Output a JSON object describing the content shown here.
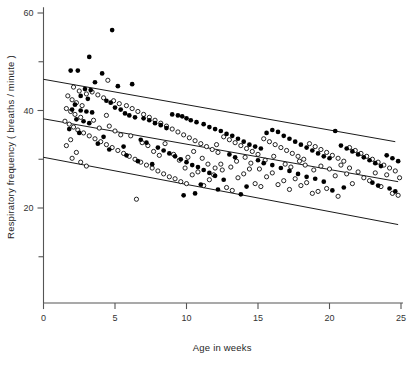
{
  "chart_data": {
    "type": "scatter",
    "title": "",
    "xlabel": "Age in weeks",
    "ylabel": "Respiratory frequency ( breaths / minute )",
    "xlim": [
      0,
      25
    ],
    "ylim": [
      0,
      60
    ],
    "xticks": [
      0,
      5,
      10,
      15,
      20,
      25
    ],
    "xtick_labels": [
      "0",
      "5",
      "10",
      "15",
      "20",
      "25"
    ],
    "yticks": [
      10,
      20,
      30,
      40,
      50,
      60
    ],
    "ytick_labels": [
      "",
      "20",
      "",
      "40",
      "",
      "60"
    ],
    "ytick_labeled": [
      20,
      40,
      60
    ],
    "grid": false,
    "legend_position": "none",
    "series": [
      {
        "name": "filled-circles",
        "marker": "filled-circle",
        "color": "#000000",
        "points": [
          [
            4.8,
            56.5
          ],
          [
            3.2,
            51.0
          ],
          [
            1.9,
            48.2
          ],
          [
            2.4,
            48.2
          ],
          [
            4.1,
            47.6
          ],
          [
            3.6,
            45.8
          ],
          [
            5.2,
            45.0
          ],
          [
            2.9,
            44.4
          ],
          [
            3.3,
            44.2
          ],
          [
            6.2,
            45.4
          ],
          [
            2.6,
            43.0
          ],
          [
            3.1,
            42.4
          ],
          [
            4.4,
            42.0
          ],
          [
            4.7,
            41.6
          ],
          [
            2.2,
            41.2
          ],
          [
            2.0,
            40.2
          ],
          [
            2.6,
            40.0
          ],
          [
            3.0,
            39.8
          ],
          [
            3.4,
            39.6
          ],
          [
            5.0,
            40.6
          ],
          [
            5.4,
            40.2
          ],
          [
            5.7,
            39.4
          ],
          [
            6.0,
            39.0
          ],
          [
            6.4,
            38.6
          ],
          [
            2.3,
            38.2
          ],
          [
            2.8,
            37.8
          ],
          [
            3.2,
            37.4
          ],
          [
            7.0,
            38.4
          ],
          [
            7.4,
            38.0
          ],
          [
            7.8,
            37.4
          ],
          [
            1.8,
            36.2
          ],
          [
            2.5,
            35.4
          ],
          [
            8.2,
            37.0
          ],
          [
            8.6,
            36.4
          ],
          [
            9.0,
            39.2
          ],
          [
            9.4,
            39.0
          ],
          [
            9.7,
            38.8
          ],
          [
            10.0,
            38.4
          ],
          [
            10.3,
            38.0
          ],
          [
            10.7,
            37.6
          ],
          [
            6.8,
            34.0
          ],
          [
            7.2,
            33.4
          ],
          [
            5.6,
            32.6
          ],
          [
            4.6,
            32.0
          ],
          [
            3.8,
            33.2
          ],
          [
            8.0,
            32.4
          ],
          [
            8.4,
            31.8
          ],
          [
            8.8,
            31.2
          ],
          [
            11.2,
            37.2
          ],
          [
            11.6,
            36.6
          ],
          [
            12.0,
            36.2
          ],
          [
            12.4,
            35.8
          ],
          [
            12.8,
            35.2
          ],
          [
            9.2,
            30.6
          ],
          [
            9.6,
            30.0
          ],
          [
            10.0,
            29.4
          ],
          [
            10.4,
            28.8
          ],
          [
            10.8,
            28.4
          ],
          [
            13.2,
            34.8
          ],
          [
            13.6,
            34.2
          ],
          [
            14.0,
            33.6
          ],
          [
            14.4,
            33.0
          ],
          [
            11.2,
            27.8
          ],
          [
            11.6,
            27.2
          ],
          [
            12.0,
            26.6
          ],
          [
            13.0,
            31.0
          ],
          [
            13.4,
            30.4
          ],
          [
            14.8,
            32.6
          ],
          [
            15.2,
            32.2
          ],
          [
            15.6,
            35.4
          ],
          [
            16.0,
            36.0
          ],
          [
            16.4,
            35.6
          ],
          [
            16.8,
            34.8
          ],
          [
            17.2,
            34.2
          ],
          [
            17.6,
            33.6
          ],
          [
            15.0,
            29.8
          ],
          [
            15.4,
            29.2
          ],
          [
            16.0,
            28.8
          ],
          [
            16.6,
            28.2
          ],
          [
            12.6,
            25.8
          ],
          [
            18.0,
            33.0
          ],
          [
            18.4,
            32.4
          ],
          [
            18.8,
            31.8
          ],
          [
            19.2,
            31.2
          ],
          [
            19.6,
            30.6
          ],
          [
            17.2,
            27.6
          ],
          [
            17.8,
            27.0
          ],
          [
            18.4,
            26.4
          ],
          [
            20.0,
            30.2
          ],
          [
            20.4,
            35.8
          ],
          [
            20.8,
            32.8
          ],
          [
            21.2,
            32.2
          ],
          [
            21.6,
            31.6
          ],
          [
            22.0,
            31.0
          ],
          [
            22.4,
            30.4
          ],
          [
            19.0,
            26.0
          ],
          [
            19.6,
            25.4
          ],
          [
            22.8,
            29.8
          ],
          [
            23.2,
            29.2
          ],
          [
            23.6,
            28.6
          ],
          [
            24.0,
            30.8
          ],
          [
            24.4,
            30.2
          ],
          [
            24.8,
            29.6
          ],
          [
            23.0,
            25.2
          ],
          [
            23.4,
            24.6
          ],
          [
            21.0,
            24.2
          ],
          [
            20.2,
            23.6
          ],
          [
            9.8,
            22.6
          ],
          [
            10.6,
            23.0
          ],
          [
            12.2,
            23.8
          ],
          [
            14.2,
            24.4
          ],
          [
            7.6,
            29.0
          ],
          [
            6.6,
            29.6
          ],
          [
            5.8,
            30.8
          ],
          [
            4.2,
            34.6
          ],
          [
            24.2,
            24.0
          ],
          [
            24.6,
            23.4
          ],
          [
            13.8,
            22.8
          ],
          [
            11.0,
            24.8
          ]
        ]
      },
      {
        "name": "open-circles",
        "marker": "open-circle",
        "color": "#000000",
        "points": [
          [
            4.5,
            46.2
          ],
          [
            2.1,
            44.8
          ],
          [
            2.5,
            44.0
          ],
          [
            3.0,
            43.4
          ],
          [
            1.7,
            43.0
          ],
          [
            2.0,
            42.2
          ],
          [
            2.3,
            41.6
          ],
          [
            2.7,
            41.0
          ],
          [
            3.4,
            43.8
          ],
          [
            3.8,
            43.2
          ],
          [
            1.6,
            40.4
          ],
          [
            1.9,
            39.8
          ],
          [
            2.2,
            39.2
          ],
          [
            2.6,
            38.6
          ],
          [
            4.2,
            42.6
          ],
          [
            4.9,
            42.0
          ],
          [
            5.3,
            41.4
          ],
          [
            1.5,
            37.8
          ],
          [
            1.8,
            37.2
          ],
          [
            2.1,
            36.6
          ],
          [
            5.8,
            41.0
          ],
          [
            6.2,
            40.4
          ],
          [
            6.6,
            39.8
          ],
          [
            2.4,
            36.0
          ],
          [
            2.8,
            35.4
          ],
          [
            7.0,
            39.2
          ],
          [
            7.4,
            38.6
          ],
          [
            3.2,
            34.8
          ],
          [
            3.6,
            34.2
          ],
          [
            4.0,
            33.6
          ],
          [
            7.8,
            38.0
          ],
          [
            8.2,
            37.4
          ],
          [
            8.6,
            36.8
          ],
          [
            4.4,
            33.0
          ],
          [
            4.8,
            32.4
          ],
          [
            9.0,
            36.2
          ],
          [
            9.4,
            35.6
          ],
          [
            5.2,
            31.8
          ],
          [
            5.6,
            31.2
          ],
          [
            6.0,
            30.6
          ],
          [
            9.8,
            35.0
          ],
          [
            10.2,
            34.4
          ],
          [
            10.6,
            33.8
          ],
          [
            6.4,
            30.0
          ],
          [
            6.8,
            29.4
          ],
          [
            11.0,
            33.2
          ],
          [
            11.4,
            32.6
          ],
          [
            7.2,
            28.8
          ],
          [
            7.6,
            28.2
          ],
          [
            8.0,
            27.6
          ],
          [
            11.8,
            32.0
          ],
          [
            12.2,
            31.4
          ],
          [
            12.6,
            34.6
          ],
          [
            8.4,
            27.0
          ],
          [
            8.8,
            26.4
          ],
          [
            13.0,
            34.0
          ],
          [
            13.4,
            33.4
          ],
          [
            9.2,
            26.0
          ],
          [
            9.6,
            25.4
          ],
          [
            10.0,
            25.0
          ],
          [
            13.8,
            32.8
          ],
          [
            14.2,
            32.2
          ],
          [
            14.6,
            31.6
          ],
          [
            10.4,
            26.8
          ],
          [
            10.8,
            27.4
          ],
          [
            15.0,
            31.0
          ],
          [
            15.4,
            34.2
          ],
          [
            15.8,
            33.6
          ],
          [
            11.2,
            24.6
          ],
          [
            11.6,
            25.8
          ],
          [
            16.2,
            33.0
          ],
          [
            16.6,
            32.4
          ],
          [
            17.0,
            31.8
          ],
          [
            12.0,
            28.2
          ],
          [
            12.4,
            29.0
          ],
          [
            17.4,
            31.2
          ],
          [
            17.8,
            30.6
          ],
          [
            12.8,
            24.2
          ],
          [
            13.2,
            23.6
          ],
          [
            13.6,
            26.2
          ],
          [
            18.2,
            30.0
          ],
          [
            18.6,
            33.2
          ],
          [
            19.0,
            32.6
          ],
          [
            14.0,
            27.0
          ],
          [
            14.4,
            28.0
          ],
          [
            19.4,
            32.0
          ],
          [
            19.8,
            31.4
          ],
          [
            20.2,
            30.8
          ],
          [
            14.8,
            25.0
          ],
          [
            15.2,
            24.4
          ],
          [
            20.6,
            30.2
          ],
          [
            21.0,
            29.6
          ],
          [
            21.4,
            32.4
          ],
          [
            15.6,
            26.4
          ],
          [
            16.0,
            27.2
          ],
          [
            21.8,
            31.8
          ],
          [
            22.2,
            31.2
          ],
          [
            22.6,
            30.6
          ],
          [
            16.4,
            24.8
          ],
          [
            16.8,
            25.6
          ],
          [
            23.0,
            30.0
          ],
          [
            23.4,
            29.4
          ],
          [
            23.8,
            28.8
          ],
          [
            17.2,
            23.8
          ],
          [
            17.6,
            26.0
          ],
          [
            24.2,
            28.2
          ],
          [
            24.6,
            27.6
          ],
          [
            24.0,
            26.8
          ],
          [
            18.0,
            24.6
          ],
          [
            18.4,
            25.2
          ],
          [
            22.4,
            26.2
          ],
          [
            22.8,
            25.6
          ],
          [
            23.2,
            27.2
          ],
          [
            19.2,
            23.4
          ],
          [
            19.8,
            24.0
          ],
          [
            20.4,
            26.6
          ],
          [
            21.2,
            27.0
          ],
          [
            21.6,
            25.0
          ],
          [
            6.5,
            21.8
          ],
          [
            1.9,
            34.0
          ],
          [
            1.6,
            32.8
          ],
          [
            2.3,
            31.4
          ],
          [
            2.0,
            30.2
          ],
          [
            2.6,
            29.4
          ],
          [
            3.0,
            28.6
          ],
          [
            3.9,
            36.4
          ],
          [
            4.6,
            36.8
          ],
          [
            5.0,
            35.8
          ],
          [
            5.4,
            35.0
          ],
          [
            6.1,
            34.8
          ],
          [
            6.9,
            33.4
          ],
          [
            7.3,
            32.8
          ],
          [
            7.7,
            31.6
          ],
          [
            8.1,
            30.8
          ],
          [
            8.5,
            33.2
          ],
          [
            9.1,
            31.0
          ],
          [
            9.5,
            29.8
          ],
          [
            10.1,
            30.4
          ],
          [
            10.5,
            31.6
          ],
          [
            11.1,
            30.2
          ],
          [
            11.5,
            29.0
          ],
          [
            12.1,
            33.0
          ],
          [
            12.5,
            27.8
          ],
          [
            13.1,
            28.4
          ],
          [
            13.5,
            29.6
          ],
          [
            14.1,
            30.4
          ],
          [
            14.5,
            29.2
          ],
          [
            15.1,
            28.0
          ],
          [
            15.5,
            29.8
          ],
          [
            16.1,
            30.6
          ],
          [
            16.9,
            29.0
          ],
          [
            17.3,
            28.4
          ],
          [
            17.9,
            29.6
          ],
          [
            18.3,
            28.8
          ],
          [
            18.9,
            27.8
          ],
          [
            19.4,
            28.6
          ],
          [
            20.0,
            28.0
          ],
          [
            20.8,
            28.8
          ],
          [
            21.4,
            28.2
          ],
          [
            22.0,
            27.4
          ],
          [
            23.6,
            24.4
          ],
          [
            24.4,
            23.0
          ],
          [
            24.8,
            22.6
          ],
          [
            4.4,
            39.0
          ],
          [
            3.5,
            38.0
          ],
          [
            24.9,
            26.2
          ],
          [
            20.6,
            22.4
          ],
          [
            18.8,
            23.0
          ],
          [
            9.9,
            28.2
          ],
          [
            11.9,
            26.8
          ]
        ]
      }
    ],
    "reference_lines": [
      {
        "name": "upper-line",
        "x_start": 0.0,
        "y_start": 46.4,
        "x_end": 24.6,
        "y_end": 33.6,
        "color": "#000000"
      },
      {
        "name": "middle-line",
        "x_start": 0.0,
        "y_start": 38.3,
        "x_end": 24.8,
        "y_end": 25.4,
        "color": "#000000"
      },
      {
        "name": "lower-line",
        "x_start": 0.0,
        "y_start": 30.4,
        "x_end": 24.8,
        "y_end": 16.6,
        "color": "#000000"
      }
    ]
  },
  "figure": {
    "background_color": "#ffffff",
    "axis_color": "#555555",
    "marker_color": "#000000"
  }
}
